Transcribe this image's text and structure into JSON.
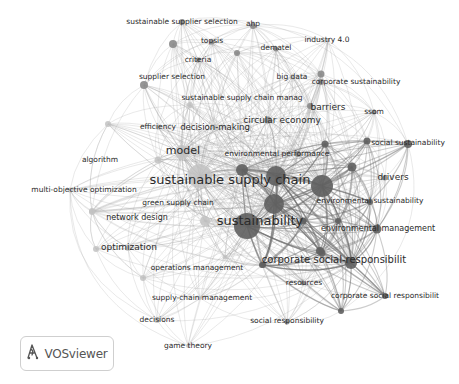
{
  "app": {
    "name": "VOSviewer"
  },
  "logo": {
    "label": "VOSviewer",
    "icon": "vosviewer-logo-icon"
  },
  "network": {
    "colors": {
      "dark": "#5f5f5f",
      "mid": "#8a8a8a",
      "light": "#c2c2c2",
      "edge": "#9a9a9a",
      "label": "#2b2b2b"
    },
    "nodes": [
      {
        "id": "sustainable supplier selection",
        "label": "sustainable supplier selection",
        "x": 182,
        "y": 22,
        "r": 3,
        "tone": "mid",
        "fs": 7.5,
        "lx": 182,
        "ly": 22
      },
      {
        "id": "ahp",
        "label": "ahp",
        "x": 253,
        "y": 26,
        "r": 3,
        "tone": "mid",
        "fs": 7.5,
        "lx": 253,
        "ly": 24
      },
      {
        "id": "topsis",
        "label": "topsis",
        "x": 212,
        "y": 42,
        "r": 2.5,
        "tone": "mid",
        "fs": 7.5,
        "lx": 212,
        "ly": 41
      },
      {
        "id": "dematel",
        "label": "dematel",
        "x": 276,
        "y": 49,
        "r": 2.5,
        "tone": "mid",
        "fs": 7.5,
        "lx": 276,
        "ly": 48
      },
      {
        "id": "industry 4.0",
        "label": "industry 4.0",
        "x": 328,
        "y": 40,
        "r": 2,
        "tone": "light",
        "fs": 7.5,
        "lx": 327,
        "ly": 40
      },
      {
        "id": "criteria",
        "label": "criteria",
        "x": 198,
        "y": 60,
        "r": 2.5,
        "tone": "mid",
        "fs": 7.5,
        "lx": 198,
        "ly": 60
      },
      {
        "id": "node-topsis-right",
        "label": "",
        "x": 237,
        "y": 53,
        "r": 3,
        "tone": "mid",
        "fs": 0,
        "lx": 0,
        "ly": 0
      },
      {
        "id": "node-ss-left",
        "label": "",
        "x": 173,
        "y": 44,
        "r": 4,
        "tone": "mid",
        "fs": 0,
        "lx": 0,
        "ly": 0
      },
      {
        "id": "supplier selection",
        "label": "supplier selection",
        "x": 144,
        "y": 85,
        "r": 4,
        "tone": "mid",
        "fs": 7.5,
        "lx": 172,
        "ly": 77
      },
      {
        "id": "big data",
        "label": "big data",
        "x": 292,
        "y": 77,
        "r": 2.5,
        "tone": "light",
        "fs": 7.5,
        "lx": 292,
        "ly": 77
      },
      {
        "id": "corporate sustainability",
        "label": "corporate sustainability",
        "x": 321,
        "y": 82,
        "r": 3,
        "tone": "mid",
        "fs": 7.5,
        "lx": 356,
        "ly": 82
      },
      {
        "id": "node-bigdata-right",
        "label": "",
        "x": 321,
        "y": 74,
        "r": 3.5,
        "tone": "mid",
        "fs": 0,
        "lx": 0,
        "ly": 0
      },
      {
        "id": "sustainable supply chain manag",
        "label": "sustainable supply chain manag",
        "x": 190,
        "y": 105,
        "r": 3,
        "tone": "light",
        "fs": 7.5,
        "lx": 242,
        "ly": 98
      },
      {
        "id": "barriers",
        "label": "barriers",
        "x": 310,
        "y": 106,
        "r": 3,
        "tone": "mid",
        "fs": 9,
        "lx": 328,
        "ly": 107
      },
      {
        "id": "ssom",
        "label": "ssom",
        "x": 374,
        "y": 112,
        "r": 2.5,
        "tone": "mid",
        "fs": 7.5,
        "lx": 374,
        "ly": 112
      },
      {
        "id": "efficiency",
        "label": "efficiency",
        "x": 158,
        "y": 127,
        "r": 2.5,
        "tone": "light",
        "fs": 7.5,
        "lx": 158,
        "ly": 127
      },
      {
        "id": "node-eff-left",
        "label": "",
        "x": 108,
        "y": 124,
        "r": 3,
        "tone": "light",
        "fs": 0,
        "lx": 0,
        "ly": 0
      },
      {
        "id": "decision-making",
        "label": "decision-making",
        "x": 215,
        "y": 127,
        "r": 3,
        "tone": "light",
        "fs": 8.5,
        "lx": 215,
        "ly": 127
      },
      {
        "id": "circular economy",
        "label": "circular economy",
        "x": 268,
        "y": 120,
        "r": 3.5,
        "tone": "mid",
        "fs": 9,
        "lx": 282,
        "ly": 120
      },
      {
        "id": "social sustainability",
        "label": "social sustainability",
        "x": 408,
        "y": 144,
        "r": 4,
        "tone": "dark",
        "fs": 7.5,
        "lx": 408,
        "ly": 143
      },
      {
        "id": "node-socsus-left",
        "label": "",
        "x": 367,
        "y": 141,
        "r": 3.5,
        "tone": "dark",
        "fs": 0,
        "lx": 0,
        "ly": 0
      },
      {
        "id": "node-circ-below",
        "label": "",
        "x": 325,
        "y": 144,
        "r": 3.5,
        "tone": "dark",
        "fs": 0,
        "lx": 0,
        "ly": 0
      },
      {
        "id": "model",
        "label": "model",
        "x": 182,
        "y": 152,
        "r": 7,
        "tone": "light",
        "fs": 11,
        "lx": 183,
        "ly": 151
      },
      {
        "id": "algorithm",
        "label": "algorithm",
        "x": 158,
        "y": 160,
        "r": 3.5,
        "tone": "light",
        "fs": 7.5,
        "lx": 100,
        "ly": 160
      },
      {
        "id": "environmental performance",
        "label": "environmental performance",
        "x": 298,
        "y": 154,
        "r": 3,
        "tone": "mid",
        "fs": 7.5,
        "lx": 277,
        "ly": 154
      },
      {
        "id": "node-envperf-right",
        "label": "",
        "x": 352,
        "y": 167,
        "r": 4.5,
        "tone": "dark",
        "fs": 0,
        "lx": 0,
        "ly": 0
      },
      {
        "id": "node-c1",
        "label": "",
        "x": 242,
        "y": 170,
        "r": 6,
        "tone": "dark",
        "fs": 0,
        "lx": 0,
        "ly": 0
      },
      {
        "id": "node-c2",
        "label": "",
        "x": 276,
        "y": 176,
        "r": 10,
        "tone": "dark",
        "fs": 0,
        "lx": 0,
        "ly": 0
      },
      {
        "id": "node-c3",
        "label": "",
        "x": 322,
        "y": 186,
        "r": 11,
        "tone": "dark",
        "fs": 0,
        "lx": 0,
        "ly": 0
      },
      {
        "id": "drivers",
        "label": "drivers",
        "x": 385,
        "y": 178,
        "r": 2.5,
        "tone": "mid",
        "fs": 9,
        "lx": 393,
        "ly": 177
      },
      {
        "id": "sustainable supply chain",
        "label": "sustainable supply chain",
        "x": 200,
        "y": 176,
        "r": 12,
        "tone": "light",
        "fs": 13,
        "lx": 230,
        "ly": 180
      },
      {
        "id": "multi-objective optimization",
        "label": "multi-objective optimization",
        "x": 70,
        "y": 190,
        "r": 2.5,
        "tone": "light",
        "fs": 7.5,
        "lx": 84,
        "ly": 190
      },
      {
        "id": "node-c4",
        "label": "",
        "x": 274,
        "y": 204,
        "r": 10,
        "tone": "dark",
        "fs": 0,
        "lx": 0,
        "ly": 0
      },
      {
        "id": "environmental sustainability",
        "label": "environmental sustainability",
        "x": 370,
        "y": 202,
        "r": 3,
        "tone": "dark",
        "fs": 7.5,
        "lx": 370,
        "ly": 201
      },
      {
        "id": "green supply chain",
        "label": "green supply chain",
        "x": 182,
        "y": 203,
        "r": 2.5,
        "tone": "light",
        "fs": 7.5,
        "lx": 178,
        "ly": 203
      },
      {
        "id": "network design",
        "label": "network design",
        "x": 92,
        "y": 211,
        "r": 3,
        "tone": "light",
        "fs": 8,
        "lx": 137,
        "ly": 217
      },
      {
        "id": "node-nd-left",
        "label": "",
        "x": 92,
        "y": 212,
        "r": 3,
        "tone": "light",
        "fs": 0,
        "lx": 0,
        "ly": 0
      },
      {
        "id": "sustainability",
        "label": "sustainability",
        "x": 247,
        "y": 226,
        "r": 13,
        "tone": "dark",
        "fs": 13,
        "lx": 260,
        "ly": 221
      },
      {
        "id": "node-sus-left",
        "label": "",
        "x": 205,
        "y": 221,
        "r": 5,
        "tone": "light",
        "fs": 0,
        "lx": 0,
        "ly": 0
      },
      {
        "id": "node-sus-right1",
        "label": "",
        "x": 303,
        "y": 221,
        "r": 3.5,
        "tone": "dark",
        "fs": 0,
        "lx": 0,
        "ly": 0
      },
      {
        "id": "node-sus-right2",
        "label": "",
        "x": 338,
        "y": 221,
        "r": 3,
        "tone": "dark",
        "fs": 0,
        "lx": 0,
        "ly": 0
      },
      {
        "id": "environmental management",
        "label": "environmental management",
        "x": 377,
        "y": 229,
        "r": 4.5,
        "tone": "dark",
        "fs": 8,
        "lx": 378,
        "ly": 228
      },
      {
        "id": "node-opt-left",
        "label": "",
        "x": 96,
        "y": 249,
        "r": 3,
        "tone": "light",
        "fs": 0,
        "lx": 0,
        "ly": 0
      },
      {
        "id": "optimization",
        "label": "optimization",
        "x": 128,
        "y": 248,
        "r": 3,
        "tone": "light",
        "fs": 9,
        "lx": 129,
        "ly": 247
      },
      {
        "id": "node-opt-right",
        "label": "",
        "x": 225,
        "y": 257,
        "r": 2.5,
        "tone": "light",
        "fs": 0,
        "lx": 0,
        "ly": 0
      },
      {
        "id": "node-csr-left",
        "label": "",
        "x": 320,
        "y": 251,
        "r": 4,
        "tone": "dark",
        "fs": 0,
        "lx": 0,
        "ly": 0
      },
      {
        "id": "corporate social-responsibilit",
        "label": "corporate social-responsibilit",
        "x": 351,
        "y": 263,
        "r": 6,
        "tone": "dark",
        "fs": 10,
        "lx": 334,
        "ly": 260
      },
      {
        "id": "node-csr-up",
        "label": "",
        "x": 322,
        "y": 253,
        "r": 3.5,
        "tone": "dark",
        "fs": 0,
        "lx": 0,
        "ly": 0
      },
      {
        "id": "operations management",
        "label": "operations management",
        "x": 143,
        "y": 278,
        "r": 3,
        "tone": "light",
        "fs": 7.5,
        "lx": 197,
        "ly": 268
      },
      {
        "id": "node-opm-right",
        "label": "",
        "x": 263,
        "y": 265,
        "r": 3,
        "tone": "dark",
        "fs": 0,
        "lx": 0,
        "ly": 0
      },
      {
        "id": "resources",
        "label": "resources",
        "x": 303,
        "y": 283,
        "r": 2.5,
        "tone": "mid",
        "fs": 7.5,
        "lx": 304,
        "ly": 283
      },
      {
        "id": "node-res-left",
        "label": "",
        "x": 262,
        "y": 265,
        "r": 3,
        "tone": "dark",
        "fs": 0,
        "lx": 0,
        "ly": 0
      },
      {
        "id": "supply-chain management",
        "label": "supply-chain management",
        "x": 200,
        "y": 298,
        "r": 2,
        "tone": "light",
        "fs": 7.5,
        "lx": 202,
        "ly": 298
      },
      {
        "id": "corporate social responsibilit",
        "label": "corporate social responsibilit",
        "x": 385,
        "y": 296,
        "r": 3,
        "tone": "dark",
        "fs": 7.5,
        "lx": 385,
        "ly": 296
      },
      {
        "id": "node-csr2-left",
        "label": "",
        "x": 341,
        "y": 311,
        "r": 3,
        "tone": "dark",
        "fs": 0,
        "lx": 0,
        "ly": 0
      },
      {
        "id": "decisions",
        "label": "decisions",
        "x": 157,
        "y": 320,
        "r": 3,
        "tone": "light",
        "fs": 7.5,
        "lx": 157,
        "ly": 320
      },
      {
        "id": "social responsibility",
        "label": "social responsibility",
        "x": 287,
        "y": 322,
        "r": 2.5,
        "tone": "mid",
        "fs": 7.5,
        "lx": 287,
        "ly": 321
      },
      {
        "id": "game theory",
        "label": "game theory",
        "x": 188,
        "y": 346,
        "r": 2,
        "tone": "light",
        "fs": 7.5,
        "lx": 188,
        "ly": 346
      }
    ]
  }
}
